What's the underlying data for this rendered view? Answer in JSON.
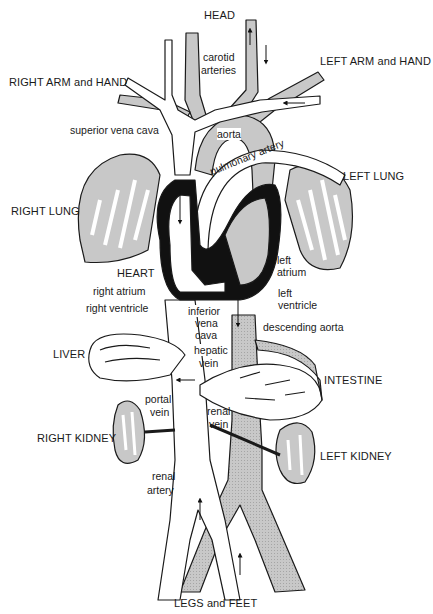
{
  "diagram": {
    "colors": {
      "oxygenated": "#c8c8c8",
      "deoxygenated": "#ffffff",
      "outline": "#1a1a1a",
      "heart_wall": "#111111"
    },
    "regions": {
      "head": "HEAD",
      "right_arm": "RIGHT ARM and HAND",
      "left_arm": "LEFT ARM and HAND",
      "right_lung": "RIGHT LUNG",
      "left_lung": "LEFT LUNG",
      "heart": "HEART",
      "liver": "LIVER",
      "intestine": "INTESTINE",
      "right_kidney": "RIGHT KIDNEY",
      "left_kidney": "LEFT KIDNEY",
      "legs": "LEGS and FEET"
    },
    "vessels": {
      "carotid_1": "carotid",
      "carotid_2": "arteries",
      "superior_vena_cava": "superior vena cava",
      "aorta": "aorta",
      "pulmonary_artery": "pulmonary artery",
      "left_atrium_1": "left",
      "left_atrium_2": "atrium",
      "left_ventricle_1": "left",
      "left_ventricle_2": "ventricle",
      "right_atrium": "right  atrium",
      "right_ventricle": "right ventricle",
      "inferior_vena_cava_1": "inferior",
      "inferior_vena_cava_2": "vena",
      "inferior_vena_cava_3": "cava",
      "descending_aorta": "descending aorta",
      "hepatic_vein_1": "hepatic",
      "hepatic_vein_2": "vein",
      "portal_vein_1": "portal",
      "portal_vein_2": "vein",
      "renal_vein_1": "renal",
      "renal_vein_2": "vein",
      "renal_artery_1": "renal",
      "renal_artery_2": "artery"
    }
  }
}
